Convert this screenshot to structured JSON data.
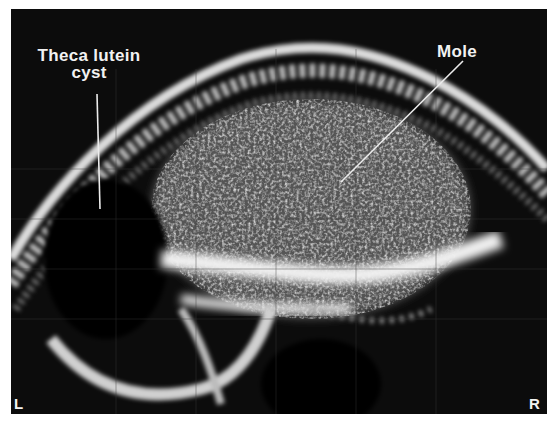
{
  "image": {
    "type": "ultrasound-scan",
    "background": "#ffffff",
    "frame_color": "#0c0c0c",
    "echo_color": "#e8e8e8"
  },
  "annotations": {
    "theca_lutein_cyst": {
      "line1": "Theca lutein",
      "line2": "cyst"
    },
    "mole": {
      "text": "Mole"
    }
  },
  "orientation": {
    "left": "L",
    "right": "R"
  }
}
